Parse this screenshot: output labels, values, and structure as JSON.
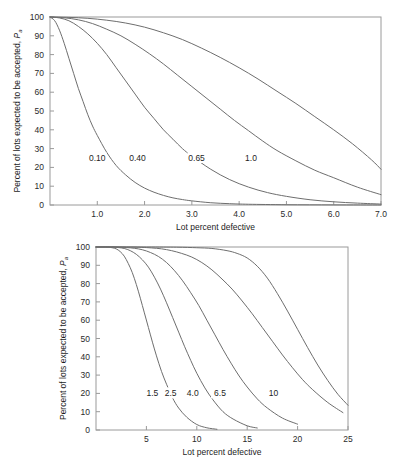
{
  "figure": {
    "name": "operating-characteristic-curves",
    "background": "#ffffff",
    "curve_color": "#6e6e6e",
    "axis_color": "#9a9a9a"
  },
  "chart_data": [
    {
      "type": "line",
      "id": "top-chart",
      "title": "",
      "xlabel": "Lot percent defective",
      "ylabel": "Percent of lots expected to be accepted, P",
      "ylabel_subscript": "a",
      "xlim": [
        0,
        7.0
      ],
      "ylim": [
        0,
        100
      ],
      "grid": false,
      "legend": "inline-curve-labels",
      "xticks": [
        1.0,
        2.0,
        3.0,
        4.0,
        5.0,
        6.0,
        7.0
      ],
      "xticklabels": [
        "1.0",
        "2.0",
        "3.0",
        "4.0",
        "5.0",
        "6.0",
        "7.0"
      ],
      "yticks": [
        0,
        10,
        20,
        30,
        40,
        50,
        60,
        70,
        80,
        90,
        100
      ],
      "yticklabels": [
        "0",
        "10",
        "20",
        "30",
        "40",
        "50",
        "60",
        "70",
        "80",
        "90",
        "100"
      ],
      "series": [
        {
          "name": "0.10",
          "label": "0.10",
          "label_x": 1.0,
          "label_y": 25,
          "x": [
            0.0,
            0.1,
            0.2,
            0.3,
            0.4,
            0.5,
            0.6,
            0.7,
            0.8,
            0.9,
            1.0,
            1.2,
            1.4,
            1.6,
            1.8,
            2.0,
            2.2,
            2.4,
            2.6,
            2.8,
            3.0,
            3.4,
            3.8,
            4.2,
            5.0,
            6.0,
            7.0
          ],
          "y": [
            100,
            98,
            93,
            86,
            78,
            70,
            62,
            55,
            48,
            42,
            37,
            28,
            21,
            16,
            12,
            9,
            6.8,
            5.1,
            3.8,
            2.9,
            2.2,
            1.2,
            0.7,
            0.4,
            0.15,
            0.05,
            0.0
          ]
        },
        {
          "name": "0.40",
          "label": "0.40",
          "label_x": 1.85,
          "label_y": 25,
          "x": [
            0.0,
            0.2,
            0.4,
            0.6,
            0.8,
            1.0,
            1.2,
            1.4,
            1.6,
            1.8,
            2.0,
            2.2,
            2.4,
            2.6,
            2.8,
            3.0,
            3.4,
            3.8,
            4.2,
            4.6,
            5.0,
            5.5,
            6.0,
            6.5,
            7.0
          ],
          "y": [
            100,
            99.5,
            98,
            95,
            91,
            86,
            80,
            73,
            66,
            59,
            52,
            46,
            40,
            35,
            30,
            26,
            19,
            13.5,
            9.5,
            6.6,
            4.6,
            2.8,
            1.7,
            1.0,
            0.5
          ]
        },
        {
          "name": "0.65",
          "label": "0.65",
          "label_x": 3.1,
          "label_y": 25,
          "x": [
            0.0,
            0.3,
            0.6,
            0.9,
            1.2,
            1.5,
            1.8,
            2.1,
            2.4,
            2.7,
            3.0,
            3.3,
            3.6,
            3.9,
            4.2,
            4.5,
            4.8,
            5.2,
            5.6,
            6.0,
            6.5,
            7.0
          ],
          "y": [
            100,
            99.6,
            98.5,
            96.5,
            93.5,
            90,
            85.5,
            80.5,
            75,
            69,
            63,
            57,
            51,
            45,
            39.5,
            34,
            29,
            23.5,
            18.5,
            14.5,
            9.5,
            5.5
          ]
        },
        {
          "name": "1.0",
          "label": "1.0",
          "label_x": 4.25,
          "label_y": 25,
          "x": [
            0.0,
            0.4,
            0.8,
            1.2,
            1.6,
            2.0,
            2.4,
            2.8,
            3.2,
            3.6,
            4.0,
            4.4,
            4.8,
            5.2,
            5.6,
            6.0,
            6.4,
            6.8,
            7.0
          ],
          "y": [
            100,
            99.8,
            99.3,
            98.3,
            96.8,
            94.6,
            91.6,
            88,
            83.5,
            78.5,
            73,
            67,
            60.5,
            54,
            47,
            40,
            32.5,
            24,
            19
          ]
        }
      ]
    },
    {
      "type": "line",
      "id": "bottom-chart",
      "title": "",
      "xlabel": "Lot percent defective",
      "ylabel": "Percent of lots expected to be accepted, P",
      "ylabel_subscript": "a",
      "xlim": [
        0,
        25
      ],
      "ylim": [
        0,
        100
      ],
      "grid": false,
      "legend": "inline-curve-labels",
      "xticks": [
        5,
        10,
        15,
        20,
        25
      ],
      "xticklabels": [
        "5",
        "10",
        "15",
        "20",
        "25"
      ],
      "yticks": [
        0,
        10,
        20,
        30,
        40,
        50,
        60,
        70,
        80,
        90,
        100
      ],
      "yticklabels": [
        "0",
        "10",
        "20",
        "30",
        "40",
        "50",
        "60",
        "70",
        "80",
        "90",
        "100"
      ],
      "series": [
        {
          "name": "1.5",
          "label": "1.5",
          "label_x": 5.6,
          "label_y": 20,
          "x": [
            0,
            1.0,
            1.6,
            2.0,
            2.4,
            2.8,
            3.2,
            3.6,
            4.0,
            4.4,
            4.8,
            5.2,
            5.6,
            6.0,
            6.5,
            7.0,
            7.6,
            8.2,
            9.0,
            10.0,
            11.0,
            12.0
          ],
          "y": [
            100,
            100,
            99.6,
            99,
            97.5,
            95,
            91,
            86,
            79.5,
            72,
            64,
            56,
            48,
            40.5,
            32,
            25,
            17.5,
            12,
            7,
            3,
            1.2,
            0.4
          ]
        },
        {
          "name": "2.5",
          "label": "2.5",
          "label_x": 7.4,
          "label_y": 20,
          "x": [
            0,
            1.5,
            2.2,
            2.8,
            3.4,
            4.0,
            4.6,
            5.2,
            5.8,
            6.4,
            7.0,
            7.6,
            8.2,
            8.8,
            9.4,
            10.0,
            10.8,
            11.6,
            12.6,
            13.6,
            15.0,
            16.0
          ],
          "y": [
            100,
            100,
            99.7,
            99.2,
            98,
            96,
            93,
            89,
            83.5,
            77,
            69.5,
            61.5,
            53.5,
            45.5,
            38,
            31,
            23,
            16.5,
            10,
            6,
            2.3,
            1.1
          ]
        },
        {
          "name": "4.0",
          "label": "4.0",
          "label_x": 9.6,
          "label_y": 20,
          "x": [
            0,
            2.0,
            3.0,
            3.8,
            4.6,
            5.4,
            6.2,
            7.0,
            7.8,
            8.6,
            9.4,
            10.2,
            11.0,
            11.8,
            12.6,
            13.4,
            14.2,
            15.0,
            16.0,
            17.0,
            18.5,
            20.0
          ],
          "y": [
            100,
            100,
            99.7,
            99.3,
            98.5,
            97,
            94.8,
            91.5,
            87,
            81.5,
            75,
            68,
            60,
            52,
            44,
            36.5,
            29.5,
            23.5,
            17,
            12,
            6.5,
            3.2
          ]
        },
        {
          "name": "6.5",
          "label": "6.5",
          "label_x": 12.3,
          "label_y": 20,
          "x": [
            0,
            3.0,
            4.5,
            5.5,
            6.5,
            7.5,
            8.5,
            9.5,
            10.5,
            11.5,
            12.5,
            13.5,
            14.5,
            15.5,
            16.5,
            17.5,
            18.5,
            19.5,
            20.5,
            21.5,
            23.0,
            24.5
          ],
          "y": [
            100,
            100,
            99.8,
            99.5,
            99,
            98,
            96.5,
            94.5,
            91.5,
            87.5,
            82.5,
            77,
            70.5,
            63.5,
            56,
            48.5,
            41,
            34,
            27.5,
            22,
            15,
            9.5
          ]
        },
        {
          "name": "10",
          "label": "10",
          "label_x": 17.6,
          "label_y": 20,
          "x": [
            0,
            5.0,
            8.0,
            10.0,
            11.5,
            13.0,
            14.0,
            15.0,
            16.0,
            17.0,
            18.0,
            19.0,
            20.0,
            21.0,
            22.0,
            23.0,
            24.0,
            25.0
          ],
          "y": [
            100,
            100,
            99.9,
            99.6,
            99.2,
            98,
            96.5,
            94,
            89.5,
            83,
            74.5,
            65,
            55,
            45,
            35.5,
            27,
            19.5,
            13.5
          ]
        }
      ]
    }
  ]
}
